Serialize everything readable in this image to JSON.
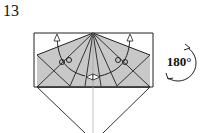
{
  "diagram": {
    "step_number": "13",
    "rotation_label": "180°",
    "colors": {
      "fill": "#c8c8c8",
      "line": "#222222",
      "background": "#ffffff"
    },
    "elements": [
      "paper-model",
      "valley-fold-arrows",
      "push-arrows",
      "rotation-symbol"
    ]
  }
}
